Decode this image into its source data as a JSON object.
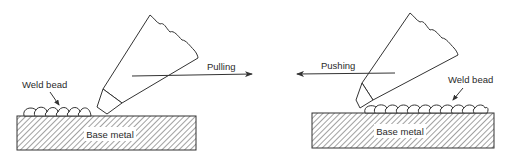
{
  "diagram": {
    "type": "welding-technique-comparison",
    "panels": [
      {
        "id": "pulling",
        "direction_label": "Pulling",
        "direction": "right",
        "bead_label": "Weld bead",
        "base_label": "Base metal",
        "bead_count": 6
      },
      {
        "id": "pushing",
        "direction_label": "Pushing",
        "direction": "left",
        "bead_label": "Weld bead",
        "base_label": "Base metal",
        "bead_count": 11
      }
    ],
    "colors": {
      "line": "#333333",
      "text": "#2a2a2a",
      "background": "#ffffff"
    }
  }
}
